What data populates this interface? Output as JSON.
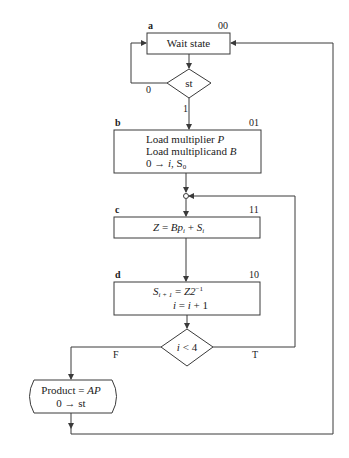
{
  "diagram": {
    "type": "ASM chart (multiplier state machine)",
    "states": [
      {
        "id": "a",
        "code": "00",
        "lines": [
          "Wait state"
        ]
      },
      {
        "id": "b",
        "code": "01",
        "lines": [
          "Load multiplier P",
          "Load multiplicand B",
          "0 → i, S0"
        ]
      },
      {
        "id": "c",
        "code": "11",
        "lines": [
          "Z = Bp_i + S_i"
        ]
      },
      {
        "id": "d",
        "code": "10",
        "lines": [
          "S_{i+1} = Z2^-1",
          "i = i + 1"
        ]
      }
    ],
    "decisions": [
      {
        "id": "st",
        "label": "st",
        "false_label": "0",
        "true_label": "1"
      },
      {
        "id": "i_lt_4",
        "label": "i < 4",
        "false_label": "F",
        "true_label": "T"
      }
    ],
    "conditional_output": {
      "lines": [
        "Product = AP",
        "0 → st"
      ]
    },
    "text": {
      "a_label": "a",
      "a_code": "00",
      "a_text": "Wait state",
      "st_text": "st",
      "st_zero": "0",
      "st_one": "1",
      "b_label": "b",
      "b_code": "01",
      "b_line1_plain": "Load multiplier ",
      "b_line1_it": "P",
      "b_line2_plain": "Load multiplicand ",
      "b_line2_it": "B",
      "b_line3_plain": "0 → ",
      "b_line3_it": "i",
      "b_line3_rest": ", S",
      "b_line3_sub": "0",
      "c_label": "c",
      "c_code": "11",
      "c_Z": "Z",
      "c_eq": " = ",
      "c_B": "Bp",
      "c_sub_i": "i",
      "c_plus": " + ",
      "c_S": "S",
      "c_sub_i2": "i",
      "d_label": "d",
      "d_code": "10",
      "d_S": "S",
      "d_sub": "i + 1",
      "d_eq": " = ",
      "d_Z": "Z2",
      "d_sup": "−1",
      "d_i": "i",
      "d_eq2": " = ",
      "d_i2": "i",
      "d_plus1": " + 1",
      "dec_i": "i",
      "dec_lt": " < 4",
      "dec_F": "F",
      "dec_T": "T",
      "prod_plain": "Product = ",
      "prod_it": "AP",
      "prod_line2": "0 → st"
    }
  }
}
